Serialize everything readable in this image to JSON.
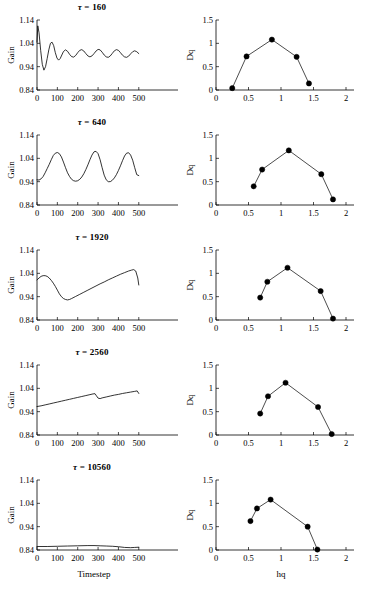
{
  "figure": {
    "rows": 5,
    "columns": 2,
    "background": "#ffffff",
    "line_color": "#000000",
    "marker_color": "#000000"
  },
  "left_axis": {
    "ylabel": "Gain",
    "xlabel": "Timestep",
    "xlabel_on_last_row_only": true,
    "yticks": [
      "0.84",
      "0.94",
      "1.04",
      "1.14"
    ],
    "ytick_values": [
      0.84,
      0.94,
      1.04,
      1.14
    ],
    "xticks": [
      "0",
      "100",
      "200",
      "300",
      "400",
      "500"
    ],
    "xtick_values": [
      0,
      100,
      200,
      300,
      400,
      500
    ],
    "xlim": [
      0,
      560
    ],
    "ylim": [
      0.84,
      1.14
    ]
  },
  "right_axis": {
    "ylabel": "Dq",
    "xlabel": "hq",
    "xlabel_on_last_row_only": true,
    "yticks": [
      "0",
      "0.5",
      "1",
      "1.5"
    ],
    "ytick_values": [
      0,
      0.5,
      1,
      1.5
    ],
    "xticks": [
      "0",
      "0.5",
      "1",
      "1.5",
      "2"
    ],
    "xtick_values": [
      0,
      0.5,
      1,
      1.5,
      2
    ],
    "xlim": [
      0,
      2
    ],
    "ylim": [
      0,
      1.5
    ]
  },
  "titles": [
    {
      "symbol": "τ",
      "eq": " = ",
      "value": "160",
      "text": "τ = 160"
    },
    {
      "symbol": "τ",
      "eq": " = ",
      "value": "640",
      "text": "τ = 640"
    },
    {
      "symbol": "τ",
      "eq": " = ",
      "value": "1920",
      "text": "τ = 1920"
    },
    {
      "symbol": "τ",
      "eq": " = ",
      "value": "2560",
      "text": "τ = 2560"
    },
    {
      "symbol": "τ",
      "eq": " = ",
      "value": "10560",
      "text": "τ = 10560"
    }
  ],
  "chart_data": [
    {
      "type": "line",
      "panel": "row1-left",
      "title": "τ = 160",
      "xlabel": "Timestep",
      "ylabel": "Gain",
      "xlim": [
        0,
        560
      ],
      "ylim": [
        0.84,
        1.14
      ],
      "grid": false,
      "description": "Damped oscillation settling near 1.00",
      "x": [
        0,
        4,
        10,
        18,
        26,
        34,
        42,
        50,
        58,
        66,
        74,
        82,
        90,
        98,
        106,
        114,
        122,
        130,
        140,
        150,
        160,
        170,
        180,
        190,
        200,
        210,
        220,
        230,
        240,
        250,
        260,
        270,
        280,
        290,
        300,
        310,
        320,
        330,
        340,
        350,
        360,
        370,
        380,
        390,
        400,
        410,
        420,
        430,
        440,
        450,
        460,
        470,
        480,
        490,
        500
      ],
      "y": [
        1.045,
        1.115,
        1.085,
        1.01,
        0.95,
        0.925,
        0.94,
        0.975,
        1.012,
        1.04,
        1.045,
        1.03,
        1.0,
        0.977,
        0.968,
        0.975,
        0.99,
        1.005,
        1.012,
        1.006,
        0.993,
        0.983,
        0.981,
        0.988,
        1.0,
        1.01,
        1.013,
        1.007,
        0.996,
        0.986,
        0.982,
        0.986,
        0.996,
        1.007,
        1.014,
        1.012,
        1.002,
        0.99,
        0.982,
        0.98,
        0.986,
        0.997,
        1.008,
        1.013,
        1.01,
        1.0,
        0.989,
        0.982,
        0.98,
        0.985,
        0.995,
        1.004,
        1.008,
        1.004,
        0.996
      ]
    },
    {
      "type": "line",
      "panel": "row1-right",
      "title": "τ = 160",
      "xlabel": "hq",
      "ylabel": "Dq",
      "xlim": [
        0,
        2
      ],
      "ylim": [
        0,
        1.5
      ],
      "grid": false,
      "markers": true,
      "x": [
        0.25,
        0.47,
        0.86,
        1.24,
        1.43
      ],
      "y": [
        0.04,
        0.72,
        1.08,
        0.71,
        0.14
      ]
    },
    {
      "type": "line",
      "panel": "row2-left",
      "title": "τ = 640",
      "xlabel": "Timestep",
      "ylabel": "Gain",
      "xlim": [
        0,
        560
      ],
      "ylim": [
        0.84,
        1.14
      ],
      "grid": false,
      "description": "Three large slow oscillations (period ~160)",
      "x": [
        0,
        10,
        20,
        30,
        40,
        50,
        60,
        70,
        80,
        90,
        100,
        110,
        120,
        130,
        140,
        150,
        160,
        170,
        180,
        190,
        200,
        210,
        220,
        230,
        240,
        250,
        260,
        270,
        280,
        290,
        300,
        310,
        320,
        330,
        340,
        350,
        360,
        370,
        380,
        390,
        400,
        410,
        420,
        430,
        440,
        450,
        460,
        470,
        480,
        490,
        500
      ],
      "y": [
        0.948,
        0.947,
        0.952,
        0.962,
        0.978,
        0.996,
        1.014,
        1.034,
        1.052,
        1.062,
        1.065,
        1.06,
        1.046,
        1.024,
        1.0,
        0.978,
        0.962,
        0.95,
        0.944,
        0.942,
        0.944,
        0.95,
        0.96,
        0.974,
        0.992,
        1.012,
        1.034,
        1.054,
        1.068,
        1.07,
        1.06,
        1.034,
        1.0,
        0.968,
        0.948,
        0.94,
        0.94,
        0.946,
        0.956,
        0.97,
        0.988,
        1.008,
        1.03,
        1.05,
        1.062,
        1.064,
        1.054,
        1.032,
        1.0,
        0.97,
        0.966
      ]
    },
    {
      "type": "line",
      "panel": "row2-right",
      "title": "τ = 640",
      "xlabel": "hq",
      "ylabel": "Dq",
      "xlim": [
        0,
        2
      ],
      "ylim": [
        0,
        1.5
      ],
      "grid": false,
      "markers": true,
      "x": [
        0.58,
        0.71,
        1.12,
        1.62,
        1.8
      ],
      "y": [
        0.4,
        0.76,
        1.17,
        0.66,
        0.12
      ]
    },
    {
      "type": "line",
      "panel": "row3-left",
      "title": "τ = 1920",
      "xlabel": "Timestep",
      "ylabel": "Gain",
      "xlim": [
        0,
        560
      ],
      "ylim": [
        0.84,
        1.14
      ],
      "grid": false,
      "description": "Bump, dip to 0.93 near t=160, then slow linear rise to 1.05 and sharp drop at t=500",
      "x": [
        0,
        10,
        20,
        30,
        40,
        50,
        60,
        70,
        80,
        90,
        100,
        110,
        120,
        130,
        140,
        150,
        160,
        170,
        190,
        210,
        230,
        250,
        270,
        290,
        310,
        330,
        350,
        370,
        390,
        410,
        430,
        450,
        465,
        475,
        485,
        495,
        500
      ],
      "y": [
        1.012,
        1.02,
        1.027,
        1.03,
        1.03,
        1.027,
        1.02,
        1.01,
        0.998,
        0.984,
        0.968,
        0.952,
        0.94,
        0.932,
        0.928,
        0.926,
        0.928,
        0.932,
        0.941,
        0.95,
        0.959,
        0.968,
        0.977,
        0.986,
        0.995,
        1.003,
        1.012,
        1.02,
        1.028,
        1.036,
        1.043,
        1.05,
        1.054,
        1.056,
        1.05,
        1.02,
        0.99
      ]
    },
    {
      "type": "line",
      "panel": "row3-right",
      "title": "τ = 1920",
      "xlabel": "hq",
      "ylabel": "Dq",
      "xlim": [
        0,
        2
      ],
      "ylim": [
        0,
        1.5
      ],
      "grid": false,
      "markers": true,
      "x": [
        0.68,
        0.79,
        1.1,
        1.61,
        1.8
      ],
      "y": [
        0.48,
        0.82,
        1.12,
        0.62,
        0.03
      ]
    },
    {
      "type": "line",
      "panel": "row4-left",
      "title": "τ = 2560",
      "xlabel": "Timestep",
      "ylabel": "Gain",
      "xlim": [
        0,
        560
      ],
      "ylim": [
        0.84,
        1.14
      ],
      "grid": false,
      "description": "Slow near-linear rise from 0.96 with a small drop near t=290 and t=500",
      "x": [
        0,
        20,
        40,
        60,
        80,
        100,
        120,
        140,
        160,
        180,
        200,
        220,
        240,
        260,
        275,
        285,
        292,
        300,
        310,
        320,
        340,
        360,
        380,
        400,
        420,
        440,
        460,
        480,
        492,
        500
      ],
      "y": [
        0.962,
        0.965,
        0.969,
        0.973,
        0.977,
        0.981,
        0.985,
        0.989,
        0.993,
        0.997,
        1.001,
        1.005,
        1.009,
        1.013,
        1.016,
        1.017,
        1.008,
        0.998,
        0.996,
        0.999,
        1.003,
        1.007,
        1.011,
        1.014,
        1.018,
        1.021,
        1.024,
        1.027,
        1.029,
        1.018
      ]
    },
    {
      "type": "line",
      "panel": "row4-right",
      "title": "τ = 2560",
      "xlabel": "hq",
      "ylabel": "Dq",
      "xlim": [
        0,
        2
      ],
      "ylim": [
        0,
        1.5
      ],
      "grid": false,
      "markers": true,
      "x": [
        0.68,
        0.8,
        1.07,
        1.57,
        1.78
      ],
      "y": [
        0.46,
        0.83,
        1.12,
        0.6,
        0.02
      ]
    },
    {
      "type": "line",
      "panel": "row5-left",
      "title": "τ = 10560",
      "xlabel": "Timestep",
      "ylabel": "Gain",
      "xlim": [
        0,
        560
      ],
      "ylim": [
        0.84,
        1.14
      ],
      "grid": false,
      "description": "Essentially flat just above 0.85 with a slight hump near t=300 and decay after t=400",
      "x": [
        0,
        50,
        100,
        150,
        200,
        250,
        280,
        310,
        340,
        370,
        400,
        430,
        460,
        480,
        500
      ],
      "y": [
        0.855,
        0.855,
        0.856,
        0.857,
        0.858,
        0.859,
        0.859,
        0.858,
        0.857,
        0.856,
        0.854,
        0.851,
        0.85,
        0.851,
        0.852
      ]
    },
    {
      "type": "line",
      "panel": "row5-right",
      "title": "τ = 10560",
      "xlabel": "hq",
      "ylabel": "Dq",
      "xlim": [
        0,
        2
      ],
      "ylim": [
        0,
        1.5
      ],
      "grid": false,
      "markers": true,
      "x": [
        0.53,
        0.63,
        0.84,
        1.41,
        1.56
      ],
      "y": [
        0.62,
        0.89,
        1.08,
        0.5,
        0.01
      ]
    }
  ]
}
